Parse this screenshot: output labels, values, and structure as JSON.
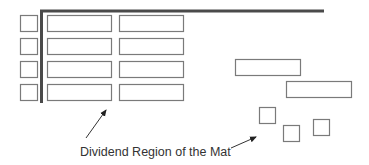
{
  "diagram": {
    "caption": "Dividend Region of the Mat",
    "colors": {
      "stroke": "#7a7a7a",
      "mat_line": "#4a4a4a",
      "text": "#333333"
    },
    "left_units": [
      {
        "x": 20,
        "y": 15,
        "w": 17,
        "h": 16
      },
      {
        "x": 20,
        "y": 38,
        "w": 17,
        "h": 16
      },
      {
        "x": 20,
        "y": 61,
        "w": 17,
        "h": 16
      },
      {
        "x": 20,
        "y": 84,
        "w": 17,
        "h": 16
      }
    ],
    "dividend_bars": [
      {
        "x": 47,
        "y": 15,
        "w": 64,
        "h": 16
      },
      {
        "x": 119,
        "y": 15,
        "w": 64,
        "h": 16
      },
      {
        "x": 47,
        "y": 38,
        "w": 64,
        "h": 16
      },
      {
        "x": 119,
        "y": 38,
        "w": 64,
        "h": 16
      },
      {
        "x": 47,
        "y": 61,
        "w": 64,
        "h": 16
      },
      {
        "x": 119,
        "y": 61,
        "w": 64,
        "h": 16
      },
      {
        "x": 47,
        "y": 84,
        "w": 64,
        "h": 16
      },
      {
        "x": 119,
        "y": 84,
        "w": 64,
        "h": 16
      }
    ],
    "loose_bars": [
      {
        "x": 235,
        "y": 59,
        "w": 65,
        "h": 16
      },
      {
        "x": 286,
        "y": 81,
        "w": 65,
        "h": 16
      }
    ],
    "loose_units": [
      {
        "x": 259,
        "y": 107,
        "w": 16,
        "h": 16
      },
      {
        "x": 283,
        "y": 125,
        "w": 16,
        "h": 16
      },
      {
        "x": 313,
        "y": 119,
        "w": 16,
        "h": 16
      }
    ]
  }
}
